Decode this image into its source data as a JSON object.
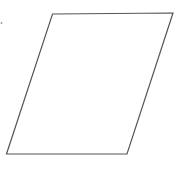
{
  "diagram": {
    "shape": "parallelogram",
    "stroke_color": "#555555",
    "fill_color": "#ffffff",
    "marks": [
      "stray-dot"
    ]
  }
}
